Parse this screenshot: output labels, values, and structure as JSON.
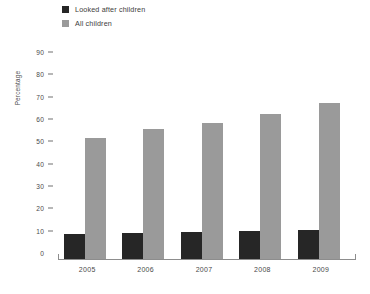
{
  "chart_data": {
    "type": "bar",
    "title": "",
    "xlabel": "",
    "ylabel": "Percentage",
    "categories": [
      "2005",
      "2006",
      "2007",
      "2008",
      "2009"
    ],
    "series": [
      {
        "name": "Looked after children",
        "color": "#262626",
        "values": [
          11,
          11.5,
          12,
          12.5,
          13
        ]
      },
      {
        "name": "All children",
        "color": "#9a9a9a",
        "values": [
          54,
          58,
          61,
          65,
          70
        ]
      }
    ],
    "ylim": [
      0,
      90
    ],
    "ytick_step": 10,
    "yticks": [
      0,
      10,
      20,
      30,
      40,
      50,
      60,
      70,
      80,
      90
    ],
    "ytick_labels": [
      "0",
      "10",
      "20",
      "30",
      "40",
      "50",
      "60",
      "70",
      "80",
      "90"
    ],
    "grid": false,
    "legend_position": "top-left",
    "axis_color": "#8d8d8d"
  }
}
